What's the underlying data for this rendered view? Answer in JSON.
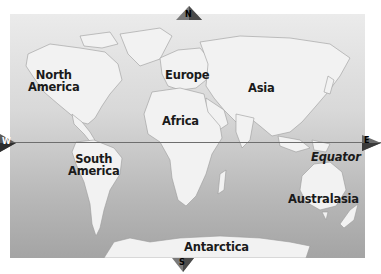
{
  "map": {
    "title": "World Map",
    "colors": {
      "land": "#f2f2f2",
      "ocean_top": "#ebebeb",
      "ocean_bottom": "#a4a4a4",
      "equator_line": "#6e6e6e",
      "label_text": "#1a1a1a"
    },
    "continents": [
      {
        "id": "north-america",
        "line1": "North",
        "line2": "America"
      },
      {
        "id": "europe",
        "line1": "Europe"
      },
      {
        "id": "asia",
        "line1": "Asia"
      },
      {
        "id": "africa",
        "line1": "Africa"
      },
      {
        "id": "south-america",
        "line1": "South",
        "line2": "America"
      },
      {
        "id": "australasia",
        "line1": "Australasia"
      },
      {
        "id": "antarctica",
        "line1": "Antarctica"
      }
    ],
    "equator_label": "Equator",
    "compass": {
      "north": "N",
      "south": "S",
      "east": "E",
      "west": "W"
    }
  }
}
